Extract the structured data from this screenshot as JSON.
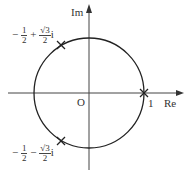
{
  "diagram": {
    "axes": {
      "re_label": "Re",
      "im_label": "Im",
      "origin_label": "O"
    },
    "circle": {
      "center": [
        89,
        93
      ],
      "radius": 55,
      "color": "#222222"
    },
    "points": [
      {
        "name": "one",
        "label": "1",
        "angle_deg": 0
      },
      {
        "name": "upper",
        "angle_deg": 120,
        "label_parts": {
          "sign1": "−",
          "num1": "1",
          "den1": "2",
          "sign2": "+",
          "num2": "√3",
          "den2": "2",
          "i": "i"
        }
      },
      {
        "name": "lower",
        "angle_deg": 240,
        "label_parts": {
          "sign1": "−",
          "num1": "1",
          "den1": "2",
          "sign2": "−",
          "num2": "√3",
          "den2": "2",
          "i": "i"
        }
      }
    ]
  }
}
